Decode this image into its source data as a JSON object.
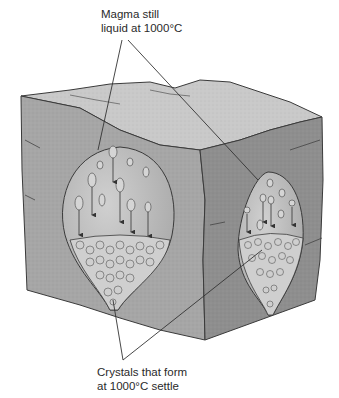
{
  "diagram": {
    "type": "geology-cross-section",
    "labels": {
      "top": {
        "line1": "Magma still",
        "line2": "liquid at 1000°C"
      },
      "bottom": {
        "line1": "Crystals that form",
        "line2": "at 1000°C settle"
      }
    },
    "chambers": [
      {
        "name": "front-face-chamber",
        "face": "front",
        "settling_arrows": 6
      },
      {
        "name": "side-face-chamber",
        "face": "right-side",
        "settling_arrows": 4
      }
    ],
    "colors": {
      "rock_top": "#c9c9c9",
      "rock_front": "#a6a6a6",
      "rock_side": "#8e8e8e",
      "magma": "#bdbdbd",
      "crystals": "#d2d2d2",
      "outline": "#3a3a3a",
      "leader_line": "#333333"
    }
  }
}
